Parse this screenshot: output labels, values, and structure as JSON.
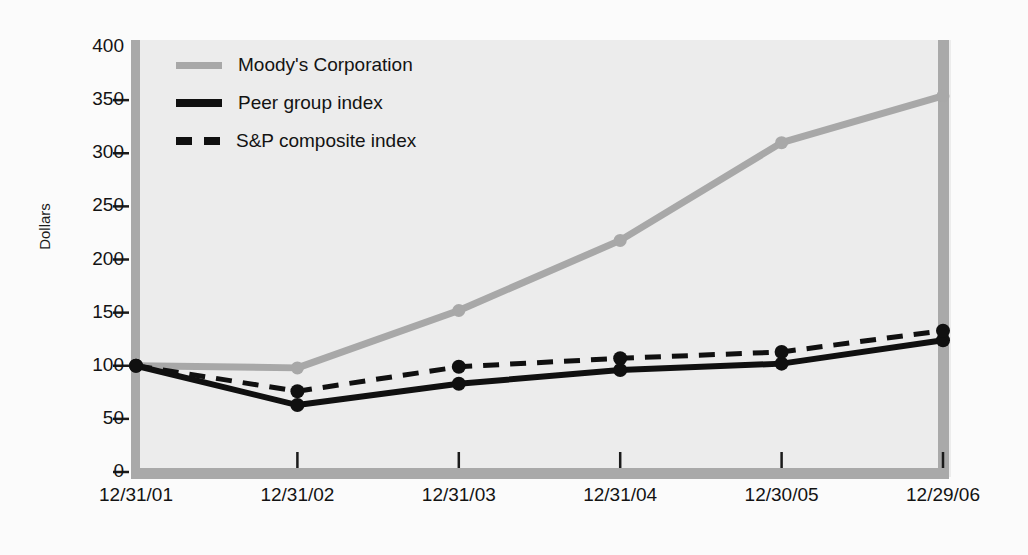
{
  "chart_data": {
    "type": "line",
    "title": "",
    "xlabel": "",
    "ylabel": "Dollars",
    "categories": [
      "12/31/01",
      "12/31/02",
      "12/31/03",
      "12/31/04",
      "12/30/05",
      "12/29/06"
    ],
    "ylim": [
      0,
      400
    ],
    "yticks": [
      0,
      50,
      100,
      150,
      200,
      250,
      300,
      350,
      400
    ],
    "grid": false,
    "legend_position": "top-left",
    "series": [
      {
        "name": "Moody's Corporation",
        "color": "#a8a8a8",
        "style": "solid",
        "width": 7,
        "marker": true,
        "values": [
          100,
          98,
          152,
          218,
          310,
          354
        ]
      },
      {
        "name": "Peer group index",
        "color": "#101010",
        "style": "solid",
        "width": 6,
        "marker": true,
        "values": [
          100,
          63,
          83,
          96,
          102,
          124
        ]
      },
      {
        "name": "S&P composite index",
        "color": "#101010",
        "style": "dashed",
        "width": 5,
        "marker": true,
        "values": [
          100,
          76,
          99,
          107,
          113,
          133
        ]
      }
    ]
  },
  "axis": {
    "y_title": "Dollars",
    "ytick_labels": [
      "400",
      "350",
      "300",
      "250",
      "200",
      "150",
      "100",
      "50",
      "0"
    ],
    "xtick_labels": [
      "12/31/01",
      "12/31/02",
      "12/31/03",
      "12/31/04",
      "12/30/05",
      "12/29/06"
    ]
  },
  "legend": {
    "items": [
      {
        "label": "Moody's Corporation",
        "swatch": "line-gray-solid-icon"
      },
      {
        "label": "Peer group index",
        "swatch": "line-black-solid-icon"
      },
      {
        "label": "S&P composite index",
        "swatch": "line-black-dashed-icon"
      }
    ]
  },
  "colors": {
    "plot_background": "#ececec",
    "page_background": "#fbfbfb",
    "axis_bar": "#a9a9a9",
    "moodys": "#a8a8a8",
    "peer": "#101010",
    "snp": "#101010"
  }
}
